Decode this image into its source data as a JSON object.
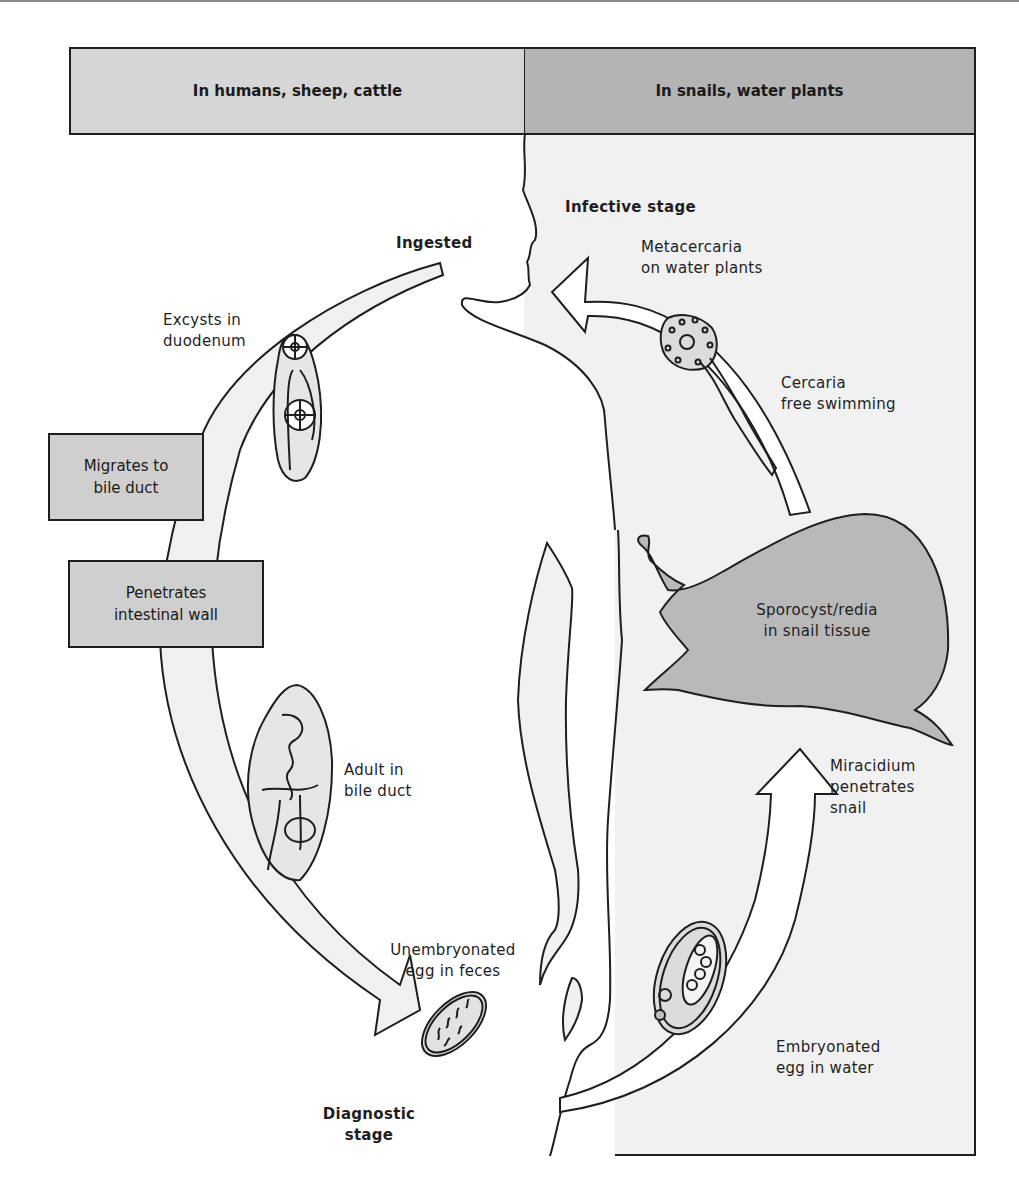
{
  "header": {
    "left_title": "In humans, sheep, cattle",
    "right_title": "In snails, water plants"
  },
  "stages": {
    "infective_stage": "Infective stage",
    "ingested": "Ingested",
    "diagnostic_stage_line1": "Diagnostic",
    "diagnostic_stage_line2": "stage"
  },
  "labels": {
    "metacercaria_line1": "Metacercaria",
    "metacercaria_line2": "on water plants",
    "cercaria_line1": "Cercaria",
    "cercaria_line2": "free swimming",
    "sporocyst_line1": "Sporocyst/redia",
    "sporocyst_line2": "in snail tissue",
    "miracidium_line1": "Miracidium",
    "miracidium_line2": "penetrates",
    "miracidium_line3": "snail",
    "embryonated_line1": "Embryonated",
    "embryonated_line2": "egg in water",
    "unembryonated_line1": "Unembryonated",
    "unembryonated_line2": "egg in feces",
    "adult_line1": "Adult in",
    "adult_line2": "bile duct",
    "excysts_line1": "Excysts in",
    "excysts_line2": "duodenum"
  },
  "boxes": {
    "migrates_line1": "Migrates to",
    "migrates_line2": "bile duct",
    "penetrates_line1": "Penetrates",
    "penetrates_line2": "intestinal wall"
  },
  "colors": {
    "left_header": "#d6d6d6",
    "right_header": "#b4b4b4",
    "right_panel": "#f1f1f1",
    "snail": "#b9b9b9",
    "arrow_fill": "#f0f0f0",
    "outline": "#1e1e1e"
  }
}
